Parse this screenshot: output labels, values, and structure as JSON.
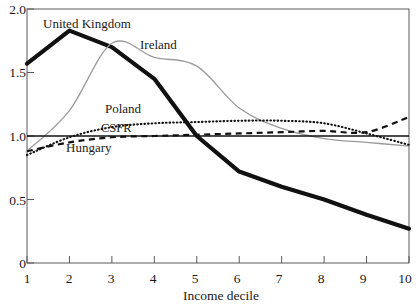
{
  "chart_data": {
    "type": "line",
    "title": "",
    "subtitle": "",
    "xlabel": "Income decile",
    "ylabel": "",
    "x": [
      1,
      2,
      3,
      4,
      5,
      6,
      7,
      8,
      9,
      10
    ],
    "xlim": [
      1,
      10
    ],
    "ylim": [
      0,
      2.0
    ],
    "grid": false,
    "legend_position": "inline-annotations",
    "xticks": [
      "1",
      "2",
      "3",
      "4",
      "5",
      "6",
      "7",
      "8",
      "9",
      "10"
    ],
    "yticks": [
      "0",
      "0.5",
      "1.0",
      "1.5",
      "2.0"
    ],
    "ytick_values": [
      0,
      0.5,
      1.0,
      1.5,
      2.0
    ],
    "series": [
      {
        "name": "United Kingdom",
        "style": "thick-solid-black",
        "color": "#111111",
        "values": [
          1.57,
          1.83,
          1.7,
          1.45,
          1.0,
          0.72,
          0.6,
          0.5,
          0.38,
          0.27
        ],
        "label_x": 2.1,
        "label_y": 1.93
      },
      {
        "name": "Ireland",
        "style": "thin-solid-gray",
        "color": "#9a9a9a",
        "values": [
          0.88,
          1.2,
          1.73,
          1.62,
          1.55,
          1.22,
          1.06,
          0.98,
          0.95,
          0.92
        ],
        "label_x": 3.7,
        "label_y": 1.73
      },
      {
        "name": "Poland",
        "style": "fine-dotted-black",
        "color": "#111111",
        "values": [
          0.85,
          0.99,
          1.07,
          1.1,
          1.11,
          1.12,
          1.12,
          1.1,
          1.02,
          0.93
        ],
        "label_x": 3.05,
        "label_y": 1.26
      },
      {
        "name": "CSFR",
        "style": "dashed-black",
        "color": "#111111",
        "values": [
          0.88,
          0.95,
          0.99,
          1.0,
          1.01,
          1.02,
          1.03,
          1.04,
          1.03,
          1.15
        ],
        "label_x": 2.95,
        "label_y": 1.115
      },
      {
        "name": "Hungary",
        "style": "thin-solid-black",
        "color": "#111111",
        "values": [
          1.0,
          1.0,
          1.0,
          1.0,
          1.0,
          1.0,
          1.0,
          1.0,
          1.0,
          1.0
        ],
        "label_x": 2.2,
        "label_y": 0.96
      }
    ]
  }
}
